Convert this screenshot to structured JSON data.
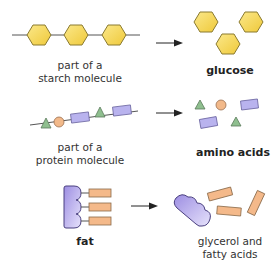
{
  "rows": [
    {
      "name": "starch",
      "input_label": [
        "part of a",
        "starch molecule"
      ],
      "output_label": [
        "glucose"
      ],
      "output_bold": true
    },
    {
      "name": "protein",
      "input_label": [
        "part of a",
        "protein molecule"
      ],
      "output_label": [
        "amino acids"
      ],
      "output_bold": true
    },
    {
      "name": "fat",
      "input_label": [
        "fat"
      ],
      "input_bold": true,
      "output_label": [
        "glycerol and",
        "fatty acids"
      ]
    }
  ],
  "colors": {
    "hexagon_fill": "#f5d84a",
    "hexagon_stroke": "#8a7a30",
    "triangle_fill": "#8fbf8f",
    "circle_fill": "#f2b98a",
    "rectangle_purple_fill": "#b9b3ee",
    "rectangle_orange_fill": "#f4b98a",
    "glycerol_fill": "#a99be6",
    "line": "#555555",
    "arrow": "#222222"
  }
}
